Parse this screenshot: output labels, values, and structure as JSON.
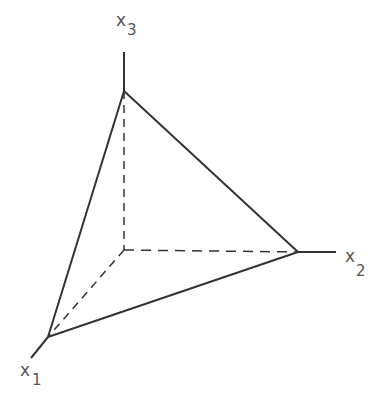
{
  "diagram": {
    "axes": [
      {
        "name": "x1",
        "label": "x",
        "subscript": "1"
      },
      {
        "name": "x2",
        "label": "x",
        "subscript": "2"
      },
      {
        "name": "x3",
        "label": "x",
        "subscript": "3"
      }
    ],
    "colors": {
      "line": "#333333",
      "text": "#555555",
      "background": "#ffffff"
    }
  }
}
